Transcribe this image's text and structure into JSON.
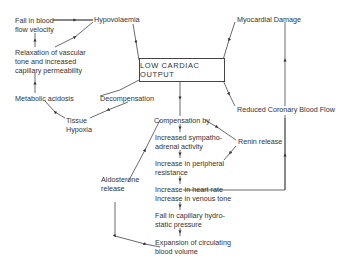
{
  "diagram": {
    "center": "LOW CARDIAC OUTPUT",
    "nodes": {
      "fall_blood_flow": "Fall in blood\nflow velocity",
      "hypovolaemia": "Hypovolaemia",
      "myocardial_damage": "Myocardial Damage",
      "relaxation": "Relaxation of vascular\ntone and increased\ncapillary permeability",
      "metabolic_acidosis": "Metabolic acidosis",
      "decompensation": "Decompensation",
      "tissue_hypoxia": "Tissue\nHypoxia",
      "reduced_coronary": "Reduced Coronary Blood Flow",
      "compensation": "Compensation by",
      "sympatho": "Increased sympatho-\nadrenal activity",
      "renin": "Renin release",
      "peripheral": "Increase in peripheral\nresistance",
      "aldosterone": "Aldosterone\nrelease",
      "heart_rate": "Increase in heart rate\nIncrease in venous tone",
      "capillary": "Fall in capillary hydro-\nstatic pressure",
      "expansion": "Expansion of circulating\nblood volume"
    }
  }
}
